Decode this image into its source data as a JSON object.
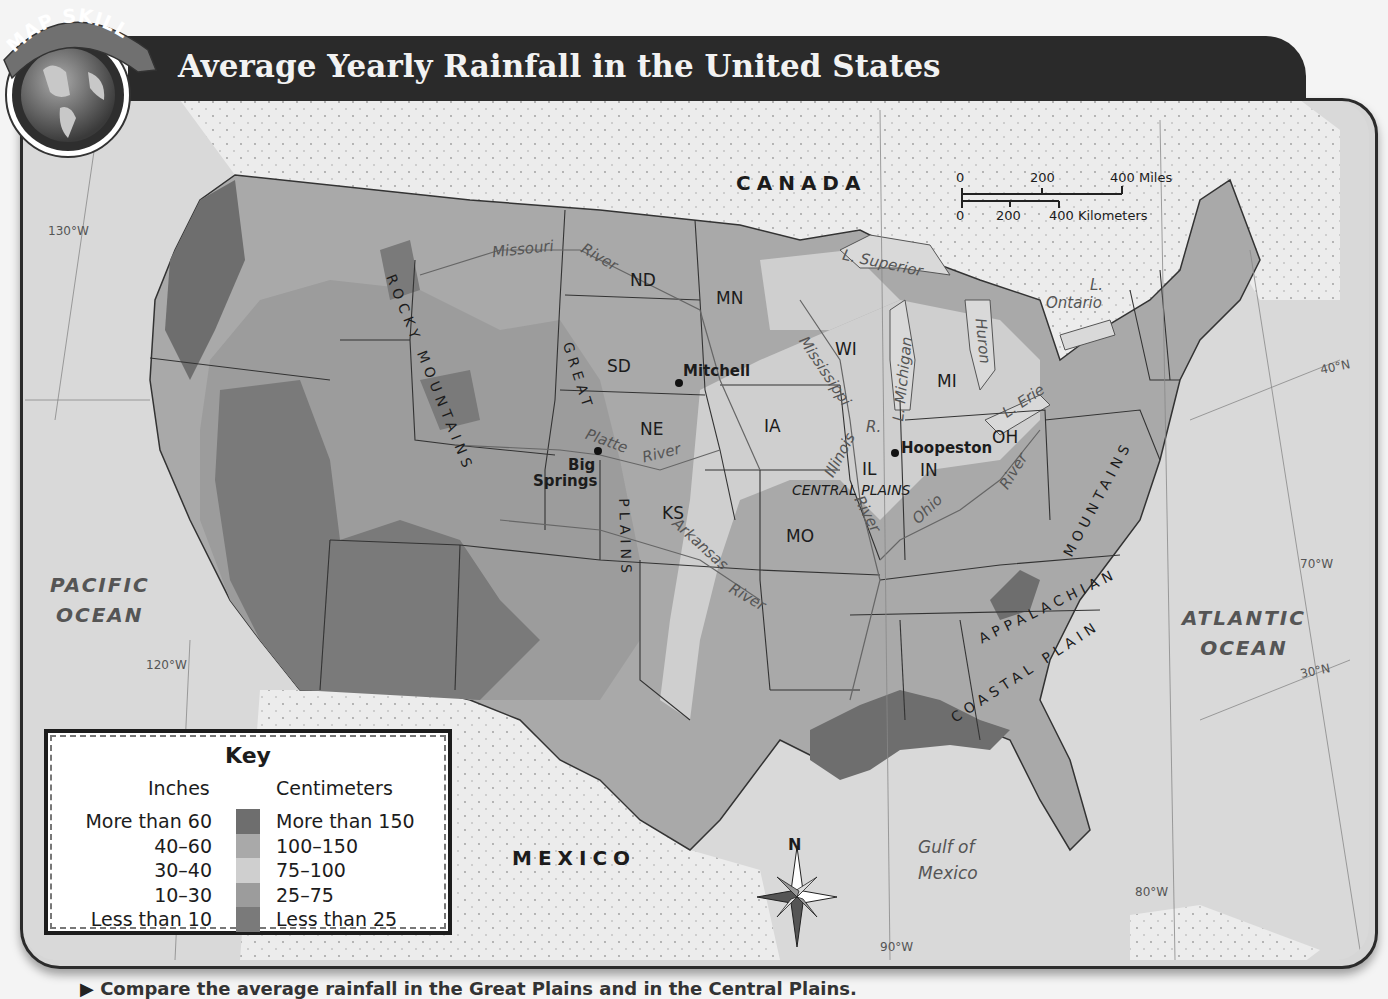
{
  "header": {
    "badge_text": "MAP SKILL",
    "title": "Average Yearly Rainfall in the United States"
  },
  "colors": {
    "more_than_60": "#6e6e6e",
    "from_40_to_60": "#a9a9a9",
    "from_30_to_40": "#cfcfcf",
    "from_10_to_30": "#9c9c9c",
    "less_than_10": "#7a7a7a",
    "water": "#d9d9d9",
    "foreign_land": "#ebebeb",
    "title_bar": "#2a2a2a"
  },
  "key": {
    "title": "Key",
    "inches_header": "Inches",
    "cm_header": "Centimeters",
    "rows": [
      {
        "inches": "More than 60",
        "cm": "More than 150",
        "color": "#6e6e6e"
      },
      {
        "inches": "40–60",
        "cm": "100–150",
        "color": "#a9a9a9"
      },
      {
        "inches": "30–40",
        "cm": "75–100",
        "color": "#cfcfcf"
      },
      {
        "inches": "10–30",
        "cm": "25–75",
        "color": "#9c9c9c"
      },
      {
        "inches": "Less than 10",
        "cm": "Less than 25",
        "color": "#7a7a7a"
      }
    ]
  },
  "scale_bar": {
    "miles": {
      "ticks": [
        "0",
        "200",
        "400 Miles"
      ]
    },
    "km": {
      "ticks": [
        "0",
        "200",
        "400 Kilometers"
      ]
    }
  },
  "labels": {
    "countries": {
      "canada": "CANADA",
      "mexico": "MEXICO"
    },
    "oceans": {
      "pacific": [
        "PACIFIC",
        "OCEAN"
      ],
      "atlantic": [
        "ATLANTIC",
        "OCEAN"
      ],
      "gulf": [
        "Gulf of",
        "Mexico"
      ]
    },
    "states": {
      "ND": "ND",
      "MN": "MN",
      "SD": "SD",
      "NE": "NE",
      "KS": "KS",
      "MO": "MO",
      "IA": "IA",
      "WI": "WI",
      "MI": "MI",
      "IL": "IL",
      "IN": "IN",
      "OH": "OH"
    },
    "cities": {
      "mitchell": "Mitchell",
      "hoopeston": "Hoopeston",
      "big_springs_1": "Big",
      "big_springs_2": "Springs"
    },
    "regions": {
      "rocky": "ROCKY MOUNTAINS",
      "great_plains_1": "GREAT",
      "great_plains_2": "PLAINS",
      "central_plains": "CENTRAL PLAINS",
      "appalachian_1": "APPALACHIAN",
      "appalachian_2": "MOUNTAINS",
      "coastal_plain": "COASTAL PLAIN"
    },
    "rivers": {
      "missouri": "Missouri",
      "missouri_river": "River",
      "platte": "Platte",
      "platte_river": "River",
      "arkansas": "Arkansas",
      "arkansas_river": "River",
      "mississippi": "Mississippi",
      "mississippi_river": "River",
      "illinois": "Illinois",
      "illinois_r": "R.",
      "ohio": "Ohio",
      "ohio_river": "River"
    },
    "lakes": {
      "superior": "L. Superior",
      "michigan": "L. Michigan",
      "huron": "Huron",
      "erie": "L. Erie",
      "ontario_1": "L.",
      "ontario_2": "Ontario"
    },
    "coordinates": {
      "w130": "130°W",
      "w120": "120°W",
      "w90": "90°W",
      "w80": "80°W",
      "w70": "70°W",
      "n40": "40°N",
      "n30": "30°N"
    },
    "compass_north": "N"
  },
  "caption": "Compare the average rainfall in the Great Plains and in the Central Plains."
}
